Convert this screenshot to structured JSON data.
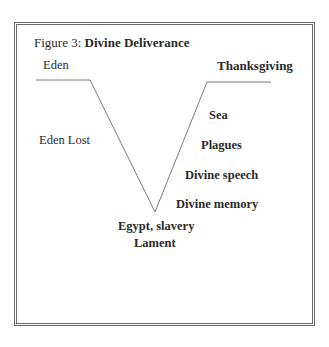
{
  "figure": {
    "title_prefix": "Figure 3: ",
    "title_bold": "Divine Deliverance"
  },
  "labels": {
    "eden": "Eden",
    "thanksgiving": "Thanksgiving",
    "eden_lost": "Eden Lost",
    "sea": "Sea",
    "plagues": "Plagues",
    "divine_speech": "Divine speech",
    "divine_memory": "Divine memory",
    "egypt_slavery": "Egypt, slavery",
    "lament": "Lament"
  },
  "shape": {
    "type": "V-curve",
    "line_color": "#7a7a7a",
    "left_plateau": {
      "x1": 36,
      "x2": 90,
      "y": 80
    },
    "vertex": {
      "x": 155,
      "y": 212
    },
    "right_plateau": {
      "x1": 207,
      "x2": 271,
      "y": 82
    }
  }
}
